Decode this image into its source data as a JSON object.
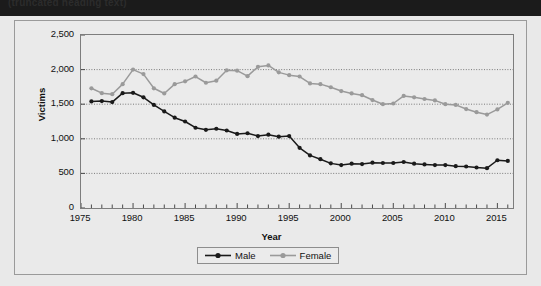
{
  "title_strip": {
    "text": "(truncated heading text)"
  },
  "chart_data": {
    "type": "line",
    "title": "",
    "xlabel": "Year",
    "ylabel": "Victims",
    "xlim": [
      1975,
      2016.5
    ],
    "ylim": [
      0,
      2500
    ],
    "grid": true,
    "grid_axis": "y",
    "legend_position": "bottom",
    "y_ticks": [
      0,
      500,
      1000,
      1500,
      2000,
      2500
    ],
    "y_tick_labels": [
      "0",
      "500",
      "1,000",
      "1,500",
      "2,000",
      "2,500"
    ],
    "x_ticks": [
      1975,
      1980,
      1985,
      1990,
      1995,
      2000,
      2005,
      2010,
      2015
    ],
    "x_tick_labels": [
      "1975",
      "1980",
      "1985",
      "1990",
      "1995",
      "2000",
      "2005",
      "2010",
      "2015"
    ],
    "x_minor_tick_step": 1,
    "x": [
      1976,
      1977,
      1978,
      1979,
      1980,
      1981,
      1982,
      1983,
      1984,
      1985,
      1986,
      1987,
      1988,
      1989,
      1990,
      1991,
      1992,
      1993,
      1994,
      1995,
      1996,
      1997,
      1998,
      1999,
      2000,
      2001,
      2002,
      2003,
      2004,
      2005,
      2006,
      2007,
      2008,
      2009,
      2010,
      2011,
      2012,
      2013,
      2014,
      2015,
      2016
    ],
    "series": [
      {
        "name": "Male",
        "color": "#1a1a1a",
        "marker": "circle",
        "values": [
          1540,
          1545,
          1530,
          1660,
          1665,
          1600,
          1490,
          1395,
          1305,
          1250,
          1160,
          1130,
          1145,
          1120,
          1070,
          1080,
          1040,
          1060,
          1030,
          1040,
          870,
          760,
          705,
          645,
          620,
          640,
          635,
          655,
          650,
          650,
          665,
          640,
          630,
          620,
          620,
          605,
          600,
          585,
          575,
          690,
          680
        ]
      },
      {
        "name": "Female",
        "color": "#9a9a9a",
        "marker": "circle",
        "values": [
          1730,
          1660,
          1645,
          1790,
          2000,
          1935,
          1730,
          1655,
          1790,
          1830,
          1900,
          1810,
          1840,
          1990,
          1985,
          1905,
          2040,
          2060,
          1960,
          1920,
          1900,
          1800,
          1790,
          1745,
          1690,
          1655,
          1630,
          1560,
          1500,
          1510,
          1620,
          1600,
          1575,
          1555,
          1500,
          1490,
          1430,
          1385,
          1350,
          1425,
          1520
        ]
      }
    ]
  },
  "legend": {
    "items": [
      {
        "label": "Male"
      },
      {
        "label": "Female"
      }
    ]
  }
}
